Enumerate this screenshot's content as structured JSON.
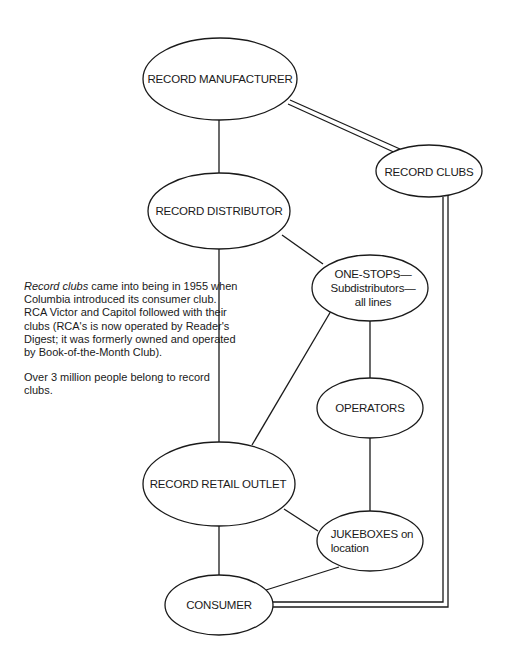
{
  "nodes": {
    "manufacturer": {
      "label": "RECORD MANUFACTURER"
    },
    "clubs": {
      "label": "RECORD CLUBS"
    },
    "distributor": {
      "label": "RECORD DISTRIBUTOR"
    },
    "one_stops": {
      "line1": "ONE-STOPS—",
      "line2": "Subdistributors—",
      "line3": "all lines"
    },
    "operators": {
      "label": "OPERATORS"
    },
    "retail": {
      "label": "RECORD RETAIL OUTLET"
    },
    "jukeboxes": {
      "line1": "JUKEBOXES on",
      "line2": "location"
    },
    "consumer": {
      "label": "CONSUMER"
    }
  },
  "edges": [
    {
      "from": "manufacturer",
      "to": "distributor",
      "style": "single"
    },
    {
      "from": "manufacturer",
      "to": "clubs",
      "style": "double"
    },
    {
      "from": "clubs",
      "to": "consumer",
      "style": "double"
    },
    {
      "from": "distributor",
      "to": "one_stops",
      "style": "single"
    },
    {
      "from": "distributor",
      "to": "retail",
      "style": "single"
    },
    {
      "from": "one_stops",
      "to": "retail",
      "style": "single"
    },
    {
      "from": "one_stops",
      "to": "operators",
      "style": "single"
    },
    {
      "from": "operators",
      "to": "jukeboxes",
      "style": "single"
    },
    {
      "from": "retail",
      "to": "jukeboxes",
      "style": "single"
    },
    {
      "from": "retail",
      "to": "consumer",
      "style": "single"
    },
    {
      "from": "jukeboxes",
      "to": "consumer",
      "style": "single"
    }
  ],
  "note": {
    "para1_italic": "Record clubs",
    "para1_rest": " came into being in 1955 when Columbia introduced its consumer club. RCA Victor and Capitol followed with their clubs (RCA's is now operated by Reader's Digest; it was formerly owned and operated by Book-of-the-Month Club).",
    "para2": "Over 3 million people belong to record clubs."
  }
}
